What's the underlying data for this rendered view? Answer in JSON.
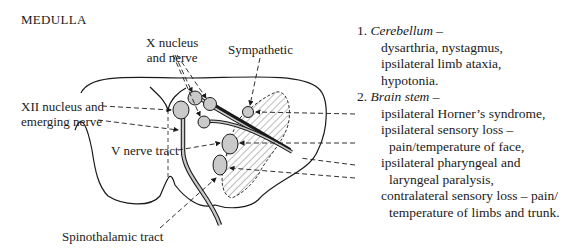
{
  "title": "MEDULLA",
  "labels": {
    "x_nucleus": [
      "X nucleus",
      "and nerve"
    ],
    "sympathetic": "Sympathetic",
    "xii_nucleus": [
      "XII nucleus and",
      "emerging nerve"
    ],
    "v_nerve_tract": "V nerve tract",
    "spinothalamic": "Spinothalamic tract"
  },
  "findings": {
    "cerebellum": {
      "number": "1.",
      "heading": "Cerebellum",
      "dash": "–",
      "items": [
        "dysarthria, nystagmus,",
        "ipsilateral limb ataxia,",
        "hypotonia."
      ]
    },
    "brain_stem": {
      "number": "2.",
      "heading": "Brain stem",
      "dash": "–",
      "items": [
        {
          "text": "ipsilateral Horner’s syndrome,",
          "indent": false
        },
        {
          "text": "ipsilateral sensory loss –",
          "indent": false
        },
        {
          "text": "pain/temperature of face,",
          "indent": true
        },
        {
          "text": "ipsilateral pharyngeal and",
          "indent": false
        },
        {
          "text": "laryngeal paralysis,",
          "indent": true
        },
        {
          "text": "contralateral sensory loss – pain/",
          "indent": false
        },
        {
          "text": "temperature of limbs and trunk.",
          "indent": true
        }
      ]
    }
  },
  "colors": {
    "ink": "#1a1a1a",
    "nucleus_fill": "#cfcfcf",
    "hatch": "#555555"
  }
}
